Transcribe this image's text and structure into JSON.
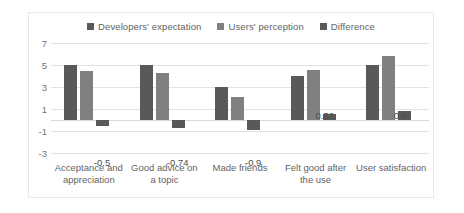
{
  "chart_data": {
    "type": "bar",
    "title": "",
    "subtitle": "",
    "xlabel": "",
    "ylabel": "",
    "ylim": [
      -3,
      7
    ],
    "yticks": [
      7,
      5,
      3,
      1,
      -1,
      -3
    ],
    "grid": true,
    "legend_position": "top-center",
    "categories": [
      "Acceptance and appreciation",
      "Good advice on a topic",
      "Made friends",
      "Felt good after the use",
      "User satisfaction"
    ],
    "series": [
      {
        "name": "Developers' expectation",
        "color": "#595959",
        "values": [
          5.0,
          5.0,
          3.0,
          4.0,
          5.0
        ]
      },
      {
        "name": "Users' perception",
        "color": "#808080",
        "values": [
          4.5,
          4.26,
          2.1,
          4.52,
          5.8
        ]
      },
      {
        "name": "Difference",
        "color": "#595959",
        "values": [
          -0.5,
          -0.74,
          -0.9,
          0.52,
          0.8
        ]
      }
    ],
    "data_labels": [
      "-0.5",
      "-0.74",
      "-0.9",
      "0.52",
      "0.8"
    ]
  },
  "legend": {
    "items": [
      {
        "label": "Developers' expectation",
        "color": "#595959"
      },
      {
        "label": "Users' perception",
        "color": "#808080"
      },
      {
        "label": "Difference",
        "color": "#595959"
      }
    ]
  },
  "axes": {
    "y_tick_labels": [
      "7",
      "5",
      "3",
      "1",
      "-1",
      "-3"
    ],
    "x_category_labels": [
      "Acceptance and appreciation",
      "Good advice on a topic",
      "Made friends",
      "Felt good after the use",
      "User satisfaction"
    ]
  }
}
